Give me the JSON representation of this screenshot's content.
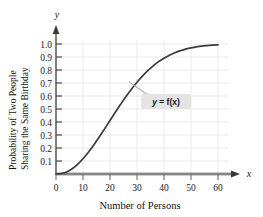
{
  "chart_data": {
    "type": "line",
    "title": "",
    "subtitle": "",
    "xlabel": "Number of Persons",
    "ylabel_line1": "Probability of Two People",
    "ylabel_line2": "Sharing the Same Birthday",
    "x_axis_symbol": "x",
    "y_axis_symbol": "y",
    "xlim": [
      0,
      64
    ],
    "ylim": [
      0,
      1.06
    ],
    "xticks": [
      0,
      10,
      20,
      30,
      40,
      50,
      60
    ],
    "xticklabels": [
      "0",
      "10",
      "20",
      "30",
      "40",
      "50",
      "60"
    ],
    "yticks": [
      0.1,
      0.2,
      0.3,
      0.4,
      0.5,
      0.6,
      0.7,
      0.8,
      0.9,
      1.0
    ],
    "yticklabels": [
      "0.1",
      "0.2",
      "0.3",
      "0.4",
      "0.5",
      "0.6",
      "0.7",
      "0.8",
      "0.9",
      "1.0"
    ],
    "grid": true,
    "legend": "none",
    "annotations": [
      {
        "text": "y = f(x)",
        "text_var": "y",
        "text_eq": " = ",
        "text_fn": "f(x)",
        "x": 36,
        "y": 0.55,
        "leader_to_x": 27,
        "leader_to_y": 0.71
      }
    ],
    "series": [
      {
        "name": "f(x)",
        "color": "#3a3a3a",
        "x": [
          0,
          2,
          4,
          6,
          8,
          10,
          12,
          14,
          16,
          18,
          20,
          22,
          23,
          24,
          26,
          28,
          30,
          32,
          34,
          36,
          38,
          40,
          42,
          44,
          46,
          48,
          50,
          52,
          54,
          56,
          58,
          60
        ],
        "y": [
          0.0,
          0.004,
          0.016,
          0.04,
          0.074,
          0.117,
          0.167,
          0.223,
          0.284,
          0.347,
          0.411,
          0.476,
          0.507,
          0.538,
          0.598,
          0.654,
          0.706,
          0.753,
          0.795,
          0.832,
          0.864,
          0.891,
          0.914,
          0.933,
          0.948,
          0.961,
          0.97,
          0.978,
          0.984,
          0.988,
          0.992,
          0.994
        ]
      }
    ],
    "colors": {
      "curve": "#3a3a3a",
      "grid": "#e8e8e8",
      "axis": "#5c5c5c",
      "axis_band": "#9a9a9a",
      "text": "#111111",
      "annotation_box": "#e3e3e3",
      "annotation_leader": "#b0b0b0"
    }
  }
}
